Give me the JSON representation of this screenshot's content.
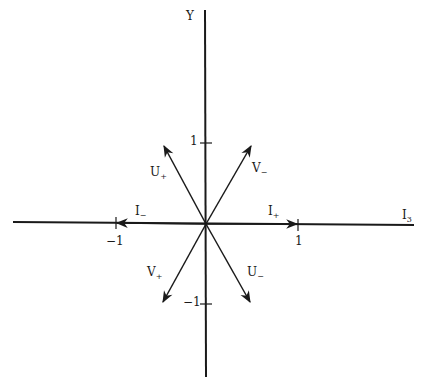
{
  "diagram": {
    "axes": {
      "x": {
        "label": "I",
        "label_sub": "3"
      },
      "y": {
        "label": "Y"
      }
    },
    "ticks": {
      "x_pos": "1",
      "x_neg": "−1",
      "y_pos": "1",
      "y_neg": "−1"
    },
    "vectors": [
      {
        "id": "I_plus",
        "label": "I",
        "sub": "+"
      },
      {
        "id": "I_minus",
        "label": "I",
        "sub": "−"
      },
      {
        "id": "U_plus",
        "label": "U",
        "sub": "+"
      },
      {
        "id": "U_minus",
        "label": "U",
        "sub": "−"
      },
      {
        "id": "V_plus",
        "label": "V",
        "sub": "+"
      },
      {
        "id": "V_minus",
        "label": "V",
        "sub": "−"
      }
    ],
    "colors": {
      "ink": "#1a1a1a",
      "background": "#ffffff"
    }
  }
}
